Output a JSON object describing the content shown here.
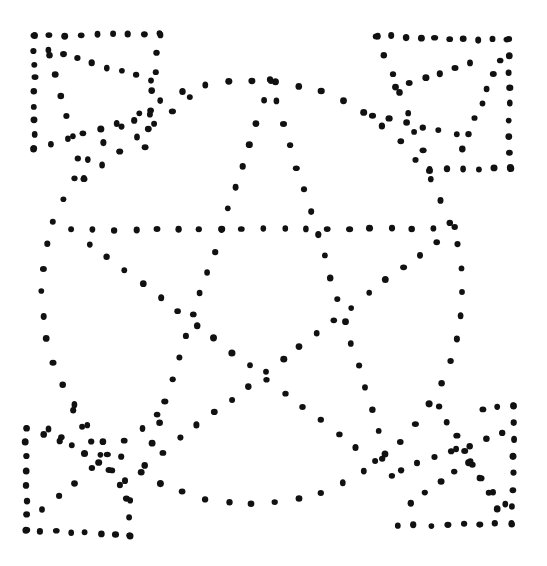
{
  "figure": {
    "background": "#ffffff",
    "dot_color": "#111111",
    "dot_radius": 3.2,
    "width": 547,
    "height": 566
  },
  "shapes": {
    "circle": {
      "cx": 252,
      "cy": 292,
      "rx": 210,
      "ry": 212,
      "dots": 56
    },
    "star": {
      "points": [
        [
          270,
          80
        ],
        [
          455,
          228
        ],
        [
          392,
          475
        ],
        [
          145,
          465
        ],
        [
          72,
          230
        ]
      ],
      "order": [
        0,
        2,
        4,
        1,
        3,
        0
      ],
      "dots_per_edge": 18
    },
    "corners": [
      {
        "name": "top-left",
        "lines": [
          [
            [
              34,
              36
            ],
            [
              160,
              34
            ],
            8
          ],
          [
            [
              34,
              36
            ],
            [
              34,
              148
            ],
            8
          ],
          [
            [
              160,
              34
            ],
            [
              145,
              148
            ],
            6
          ],
          [
            [
              48,
              50
            ],
            [
              150,
              80
            ],
            7
          ],
          [
            [
              50,
              55
            ],
            [
              84,
              178
            ],
            6
          ],
          [
            [
              84,
              178
            ],
            [
              190,
              97
            ],
            6
          ],
          [
            [
              34,
              148
            ],
            [
              150,
              115
            ],
            7
          ]
        ]
      },
      {
        "name": "top-right",
        "lines": [
          [
            [
              377,
              36
            ],
            [
              508,
              40
            ],
            9
          ],
          [
            [
              508,
              40
            ],
            [
              510,
              168
            ],
            8
          ],
          [
            [
              377,
              36
            ],
            [
              430,
              170
            ],
            7
          ],
          [
            [
              430,
              170
            ],
            [
              510,
              168
            ],
            5
          ],
          [
            [
              395,
              88
            ],
            [
              470,
              64
            ],
            5
          ],
          [
            [
              500,
              60
            ],
            [
              463,
              148
            ],
            6
          ],
          [
            [
              372,
              115
            ],
            [
              456,
              135
            ],
            5
          ]
        ]
      },
      {
        "name": "bottom-left",
        "lines": [
          [
            [
              26,
              428
            ],
            [
              26,
              530
            ],
            7
          ],
          [
            [
              26,
              530
            ],
            [
              130,
              535
            ],
            7
          ],
          [
            [
              130,
              535
            ],
            [
              126,
              480
            ],
            3
          ],
          [
            [
              73,
              411
            ],
            [
              130,
              500
            ],
            6
          ],
          [
            [
              48,
              430
            ],
            [
              110,
              470
            ],
            5
          ],
          [
            [
              158,
              414
            ],
            [
              42,
              510
            ],
            7
          ],
          [
            [
              26,
              428
            ],
            [
              60,
              440
            ],
            2
          ]
        ]
      },
      {
        "name": "bottom-right",
        "lines": [
          [
            [
              398,
              526
            ],
            [
              512,
              524
            ],
            7
          ],
          [
            [
              512,
              524
            ],
            [
              514,
              406
            ],
            7
          ],
          [
            [
              514,
              406
            ],
            [
              482,
              409
            ],
            2
          ],
          [
            [
              400,
              470
            ],
            [
              503,
              433
            ],
            6
          ],
          [
            [
              439,
              407
            ],
            [
              498,
              508
            ],
            7
          ],
          [
            [
              456,
              450
            ],
            [
              505,
              505
            ],
            4
          ],
          [
            [
              410,
              503
            ],
            [
              470,
              462
            ],
            4
          ]
        ]
      }
    ]
  }
}
